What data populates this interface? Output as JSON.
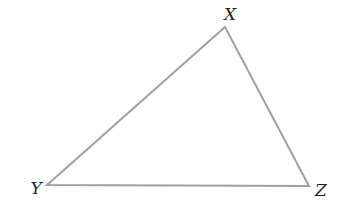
{
  "diagram": {
    "type": "triangle",
    "stroke_color": "#a0a0a0",
    "vertices": [
      {
        "label": "X",
        "x": 225,
        "y": 27,
        "label_x": 230,
        "label_y": 20
      },
      {
        "label": "Y",
        "x": 47,
        "y": 185,
        "label_x": 36,
        "label_y": 194
      },
      {
        "label": "Z",
        "x": 309,
        "y": 186,
        "label_x": 321,
        "label_y": 196
      }
    ]
  }
}
